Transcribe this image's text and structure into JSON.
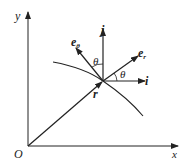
{
  "diagram": {
    "title": "",
    "labels": {
      "origin": "O",
      "x_axis": "x",
      "y_axis": "y",
      "j": "j",
      "i": "i",
      "e_theta": "e",
      "e_theta_sub": "θ",
      "e_r": "e",
      "e_r_sub": "r",
      "theta_1": "θ",
      "theta_2": "θ",
      "r": "r"
    },
    "colors": {
      "stroke": "#222222",
      "background": "#ffffff"
    }
  }
}
